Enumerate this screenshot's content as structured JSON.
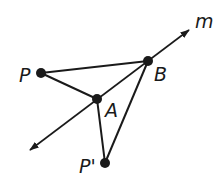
{
  "diagram": {
    "line": {
      "label": "m",
      "start": [
        30,
        150
      ],
      "end": [
        189,
        30
      ]
    },
    "points": [
      {
        "id": "P",
        "label": "P",
        "x": 41,
        "y": 73,
        "label_x": 19,
        "label_y": 82
      },
      {
        "id": "B",
        "label": "B",
        "x": 148,
        "y": 61,
        "label_x": 154,
        "label_y": 81
      },
      {
        "id": "A",
        "label": "A",
        "x": 97,
        "y": 99,
        "label_x": 105,
        "label_y": 117
      },
      {
        "id": "P_prime",
        "label": "P'",
        "x": 105,
        "y": 163,
        "label_x": 79,
        "label_y": 173
      }
    ],
    "segments": [
      {
        "from": "P",
        "to": "B"
      },
      {
        "from": "P",
        "to": "A"
      },
      {
        "from": "A",
        "to": "P_prime"
      },
      {
        "from": "B",
        "to": "P_prime"
      }
    ],
    "line_label_pos": [
      195,
      28
    ],
    "colors": {
      "stroke": "#1a1a1a",
      "background": "#ffffff"
    }
  }
}
